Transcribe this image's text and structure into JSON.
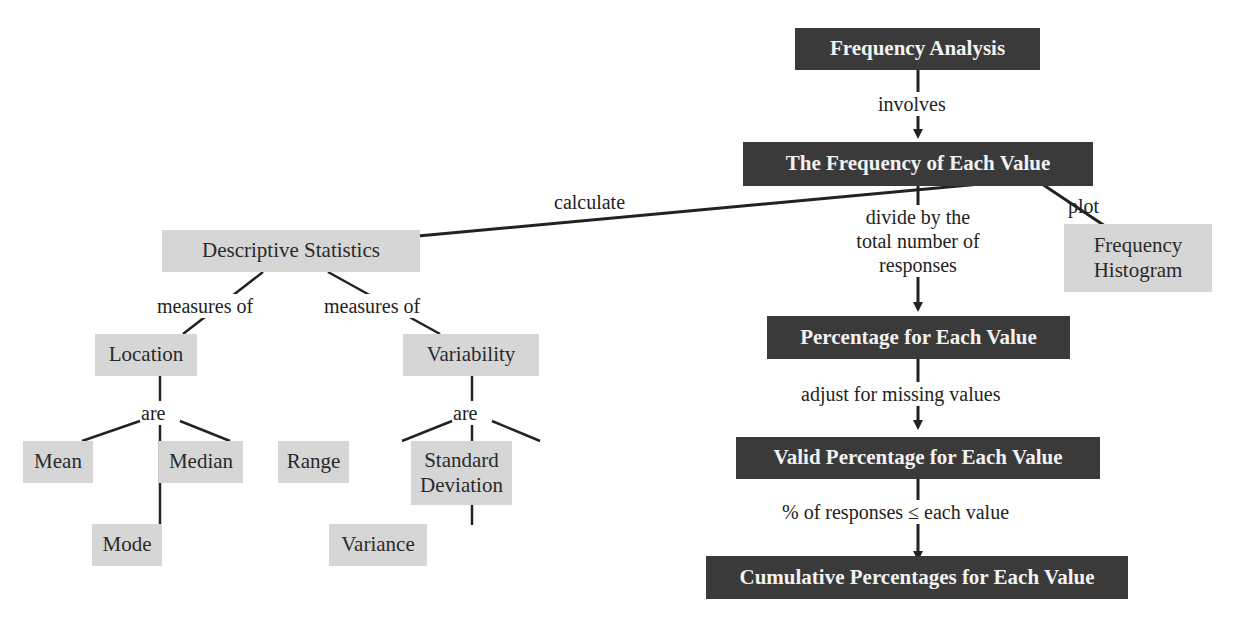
{
  "diagram": {
    "type": "concept-map",
    "colors": {
      "dark_node": "#3a3a3a",
      "light_node": "#d6d6d6",
      "line": "#222222",
      "background": "#ffffff"
    },
    "nodes": {
      "frequency_analysis": "Frequency Analysis",
      "frequency_each_value": "The Frequency of Each Value",
      "percentage_each_value": "Percentage for Each Value",
      "valid_percentage": "Valid Percentage for Each Value",
      "cumulative_percentages": "Cumulative Percentages for Each Value",
      "frequency_histogram": "Frequency Histogram",
      "descriptive_statistics": "Descriptive Statistics",
      "location": "Location",
      "variability": "Variability",
      "mean": "Mean",
      "mode": "Mode",
      "median": "Median",
      "range": "Range",
      "variance": "Variance",
      "standard_deviation": "Standard Deviation"
    },
    "edge_labels": {
      "involves": "involves",
      "calculate": "calculate",
      "plot": "plot",
      "divide": "divide by the total number of responses",
      "adjust": "adjust for missing values",
      "cumulative": "% of responses ≤ each value",
      "measures_of_location": "measures of",
      "measures_of_variability": "measures of",
      "are_location": "are",
      "are_variability": "are"
    }
  }
}
